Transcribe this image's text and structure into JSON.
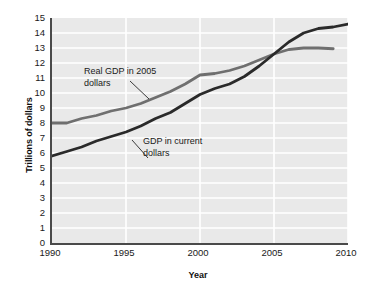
{
  "chart_data": {
    "type": "line",
    "title": "",
    "xlabel": "Year",
    "ylabel": "Trillions of dollars",
    "xlim": [
      1990,
      2010
    ],
    "ylim": [
      0,
      15
    ],
    "grid": true,
    "legend_position": "inline-annotations",
    "x_ticks": [
      "1990",
      "1995",
      "2000",
      "2005",
      "2010"
    ],
    "y_ticks": [
      "0",
      "1",
      "2",
      "3",
      "4",
      "5",
      "6",
      "7",
      "8",
      "9",
      "10",
      "11",
      "12",
      "13",
      "14",
      "15"
    ],
    "series": [
      {
        "name": "Real GDP in 2005 dollars",
        "color": "#6f6f6f",
        "x": [
          1990,
          1991,
          1992,
          1993,
          1994,
          1995,
          1996,
          1997,
          1998,
          1999,
          2000,
          2001,
          2002,
          2003,
          2004,
          2005,
          2006,
          2007,
          2008,
          2009
        ],
        "values": [
          8.0,
          8.0,
          8.3,
          8.5,
          8.8,
          9.0,
          9.3,
          9.7,
          10.1,
          10.6,
          11.2,
          11.3,
          11.5,
          11.8,
          12.2,
          12.6,
          12.9,
          13.0,
          13.0,
          12.95
        ]
      },
      {
        "name": "GDP in current dollars",
        "color": "#2a2a2a",
        "x": [
          1990,
          1991,
          1992,
          1993,
          1994,
          1995,
          1996,
          1997,
          1998,
          1999,
          2000,
          2001,
          2002,
          2003,
          2004,
          2005,
          2006,
          2007,
          2008,
          2009,
          2010
        ],
        "values": [
          5.8,
          6.1,
          6.4,
          6.8,
          7.1,
          7.4,
          7.8,
          8.3,
          8.7,
          9.3,
          9.9,
          10.3,
          10.6,
          11.1,
          11.8,
          12.6,
          13.4,
          14.0,
          14.3,
          14.4,
          14.6
        ]
      }
    ],
    "annotations": [
      {
        "text": "Real GDP in 2005\ndollars",
        "target_series": "Real GDP in 2005 dollars"
      },
      {
        "text": "GDP in current\ndollars",
        "target_series": "GDP in current dollars"
      }
    ]
  }
}
